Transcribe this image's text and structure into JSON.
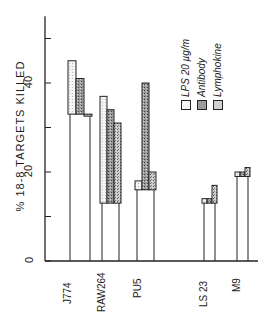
{
  "chart_data": {
    "type": "bar",
    "title": "",
    "ylabel": "% 18-8 TARGETS KILLED",
    "xlabel": "",
    "ylim": [
      0,
      55
    ],
    "yticks": [
      0,
      10,
      20,
      30,
      40,
      50
    ],
    "ytick_labels": [
      "0",
      "20",
      "40"
    ],
    "categories": [
      "J774",
      "RAW264",
      "PU5",
      "LS 23",
      "M9"
    ],
    "baseline": [
      33,
      13,
      16,
      13,
      19
    ],
    "series": [
      {
        "name": "LPS 20 µg/m",
        "values": [
          45,
          37,
          18,
          14,
          20
        ]
      },
      {
        "name": "Antibody",
        "values": [
          41,
          34,
          40,
          14,
          20
        ]
      },
      {
        "name": "Lymphokine",
        "values": [
          33,
          31,
          20,
          17,
          21
        ]
      }
    ],
    "legend_position": "upper right (rotated)",
    "grid": false
  },
  "labels": {
    "ylabel": "% 18-8 TARGETS KILLED",
    "ytick_0": "0",
    "ytick_20": "20",
    "ytick_40": "40",
    "cat_0": "J774",
    "cat_1": "RAW264",
    "cat_2": "PU5",
    "cat_3": "LS 23",
    "cat_4": "M9",
    "legend_0": "LPS 20 µg/m",
    "legend_1": "Antibody",
    "legend_2": "Lymphokine"
  }
}
